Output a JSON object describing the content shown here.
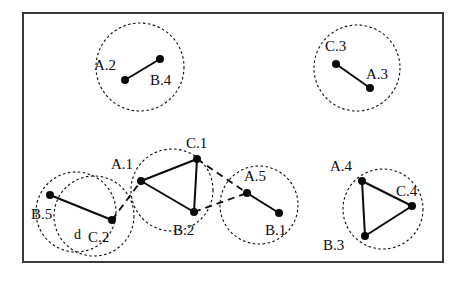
{
  "figure": {
    "background": "#ffffff",
    "ink": "#0a0a0a",
    "frame": {
      "x": 23,
      "y": 13,
      "width": 420,
      "height": 249,
      "stroke": "#3a3a3a",
      "stroke_width": 2
    },
    "distance_annotation": {
      "label": "d",
      "x": 74,
      "y": 239
    }
  },
  "clusters": [
    {
      "name": "cluster-a2-b4",
      "circles": [
        {
          "cx": 140,
          "cy": 67,
          "r": 44
        }
      ],
      "nodes": [
        {
          "id": "A.2",
          "cx": 125,
          "cy": 80,
          "label_x": 94,
          "label_y": 70,
          "r": 4
        },
        {
          "id": "B.4",
          "cx": 160,
          "cy": 59,
          "label_x": 150,
          "label_y": 85,
          "r": 4
        }
      ],
      "edges": [
        {
          "from": "A.2",
          "to": "B.4"
        }
      ]
    },
    {
      "name": "cluster-c3-a3",
      "circles": [
        {
          "cx": 357,
          "cy": 68,
          "r": 43
        }
      ],
      "nodes": [
        {
          "id": "C.3",
          "cx": 336,
          "cy": 64,
          "label_x": 325,
          "label_y": 51,
          "r": 4
        },
        {
          "id": "A.3",
          "cx": 370,
          "cy": 88,
          "label_x": 366,
          "label_y": 79,
          "r": 4
        }
      ],
      "edges": [
        {
          "from": "C.3",
          "to": "A.3"
        }
      ]
    },
    {
      "name": "cluster-b5-c2",
      "circles": [
        {
          "cx": 76,
          "cy": 212,
          "r": 40
        },
        {
          "cx": 94,
          "cy": 216,
          "r": 40
        }
      ],
      "nodes": [
        {
          "id": "B.5",
          "cx": 50,
          "cy": 195,
          "label_x": 31,
          "label_y": 219,
          "r": 4
        },
        {
          "id": "C.2",
          "cx": 112,
          "cy": 220,
          "label_x": 88,
          "label_y": 242,
          "r": 4
        }
      ],
      "edges": [
        {
          "from": "B.5",
          "to": "C.2"
        }
      ]
    },
    {
      "name": "cluster-a1-c1-b2",
      "circles": [
        {
          "cx": 172,
          "cy": 190,
          "r": 41
        }
      ],
      "nodes": [
        {
          "id": "A.1",
          "cx": 141,
          "cy": 181,
          "label_x": 111,
          "label_y": 169,
          "r": 4
        },
        {
          "id": "C.1",
          "cx": 197,
          "cy": 159,
          "label_x": 186,
          "label_y": 148,
          "r": 4
        },
        {
          "id": "B.2",
          "cx": 194,
          "cy": 212,
          "label_x": 173,
          "label_y": 235,
          "r": 4
        }
      ],
      "edges": [
        {
          "from": "A.1",
          "to": "C.1"
        },
        {
          "from": "C.1",
          "to": "B.2"
        },
        {
          "from": "A.1",
          "to": "B.2"
        }
      ]
    },
    {
      "name": "cluster-a5-b1",
      "circles": [
        {
          "cx": 259,
          "cy": 205,
          "r": 39
        }
      ],
      "nodes": [
        {
          "id": "A.5",
          "cx": 247,
          "cy": 193,
          "label_x": 244,
          "label_y": 181,
          "r": 4
        },
        {
          "id": "B.1",
          "cx": 279,
          "cy": 213,
          "label_x": 265,
          "label_y": 235,
          "r": 4
        }
      ],
      "edges": [
        {
          "from": "A.5",
          "to": "B.1"
        }
      ]
    },
    {
      "name": "cluster-a4-c4-b3",
      "circles": [
        {
          "cx": 383,
          "cy": 209,
          "r": 40
        }
      ],
      "nodes": [
        {
          "id": "A.4",
          "cx": 362,
          "cy": 181,
          "label_x": 330,
          "label_y": 171,
          "r": 4
        },
        {
          "id": "C.4",
          "cx": 412,
          "cy": 206,
          "label_x": 396,
          "label_y": 196,
          "r": 4
        },
        {
          "id": "B.3",
          "cx": 365,
          "cy": 236,
          "label_x": 323,
          "label_y": 250,
          "r": 4
        }
      ],
      "edges": [
        {
          "from": "A.4",
          "to": "C.4"
        },
        {
          "from": "C.4",
          "to": "B.3"
        },
        {
          "from": "A.4",
          "to": "B.3"
        }
      ]
    }
  ],
  "inter_cluster_links": [
    {
      "from": "C.2",
      "to": "A.1",
      "x1": 112,
      "y1": 220,
      "x2": 141,
      "y2": 181
    },
    {
      "from": "C.1",
      "to": "A.5",
      "x1": 197,
      "y1": 159,
      "x2": 247,
      "y2": 193
    },
    {
      "from": "B.2",
      "to": "A.5",
      "x1": 194,
      "y1": 212,
      "x2": 247,
      "y2": 193
    }
  ]
}
